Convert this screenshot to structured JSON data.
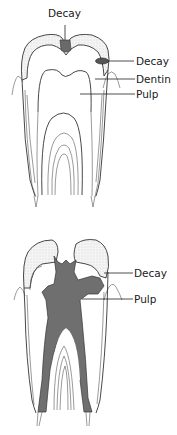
{
  "diagram": {
    "type": "tooth-decay-progression",
    "panels": [
      {
        "id": "early-decay",
        "labels": [
          {
            "key": "decay_top",
            "text": "Decay"
          },
          {
            "key": "decay_side",
            "text": "Decay"
          },
          {
            "key": "dentin",
            "text": "Dentin"
          },
          {
            "key": "pulp",
            "text": "Pulp"
          }
        ]
      },
      {
        "id": "advanced-decay",
        "labels": [
          {
            "key": "decay",
            "text": "Decay"
          },
          {
            "key": "pulp",
            "text": "Pulp"
          }
        ]
      }
    ],
    "colors": {
      "outline": "#333333",
      "enamel_stipple": "#e6e6e6",
      "decay_fill": "#707070",
      "background": "#ffffff"
    }
  }
}
